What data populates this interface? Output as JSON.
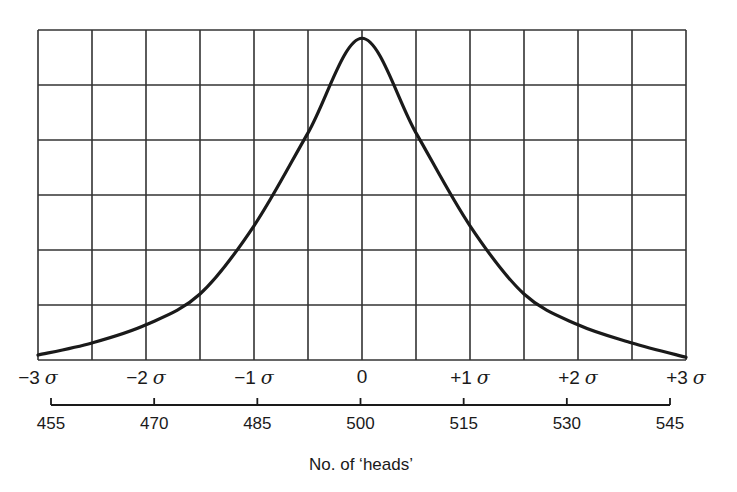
{
  "chart_data": {
    "type": "line",
    "title": "",
    "xlabel": "No. of ‘heads’",
    "ylabel": "",
    "grid": true,
    "grid_columns": 12,
    "grid_rows": 6,
    "ylim": [
      0,
      6
    ],
    "x_sigma_ticks": [
      "−3",
      "−2",
      "−1",
      "0",
      "+1",
      "+2",
      "+3"
    ],
    "sigma_symbol": "σ",
    "x_count_ticks": [
      "455",
      "470",
      "485",
      "500",
      "515",
      "530",
      "545"
    ],
    "x": [
      455,
      462.5,
      470,
      477.5,
      485,
      492.5,
      500,
      507.5,
      515,
      522.5,
      530,
      537.5,
      545
    ],
    "series": [
      {
        "name": "distribution curve",
        "values": [
          0.09,
          0.31,
          0.64,
          1.2,
          2.44,
          4.13,
          5.85,
          4.13,
          2.44,
          1.2,
          0.64,
          0.31,
          0.05
        ]
      }
    ],
    "colors": {
      "line": "#1a1a1a",
      "grid": "#333333",
      "background": "#ffffff"
    }
  }
}
